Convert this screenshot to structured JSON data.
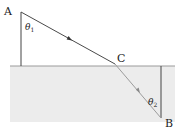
{
  "diagram": {
    "type": "light refraction at an interface",
    "colors": {
      "background": "#ffffff",
      "medium": "#ececec",
      "surface_line": "#9a9a9a",
      "ray_upper": "#4a4a4a",
      "ray_lower": "#9c9c9c",
      "normal_line": "#444444",
      "text": "#222222"
    },
    "points": {
      "A": {
        "label": "A",
        "x": 21,
        "y": 12
      },
      "C": {
        "label": "C",
        "x": 115,
        "y": 64
      },
      "B": {
        "label": "B",
        "x": 161,
        "y": 118
      }
    },
    "angles": {
      "theta1": {
        "symbol": "θ",
        "subscript": "1"
      },
      "theta2": {
        "symbol": "θ",
        "subscript": "2"
      }
    },
    "surface": {
      "y": 66,
      "x_start": 10,
      "x_end": 175
    },
    "medium": {
      "x": 10,
      "y": 66,
      "width": 165,
      "height": 56
    }
  }
}
